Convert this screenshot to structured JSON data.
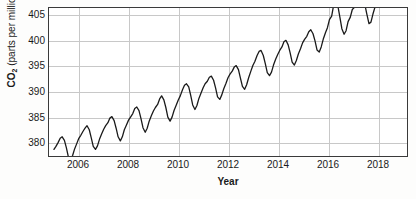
{
  "chart_data": {
    "type": "line",
    "title": "",
    "subtitle": "",
    "xlabel": "Year",
    "ylabel": "CO2 (parts per million)",
    "ylabel_prefix": "CO",
    "ylabel_subscript": "2",
    "ylabel_units": "(parts per million)",
    "xlim": [
      2004.8,
      2019.2
    ],
    "ylim": [
      377.1,
      406.4
    ],
    "grid": true,
    "legend": "none",
    "line_color": "#1a1a1a",
    "grid_color": "#c8c8c8",
    "axis_color": "#3a3a3a",
    "background_color": "#ffffff",
    "xticks": [
      2006,
      2008,
      2010,
      2012,
      2014,
      2016,
      2018
    ],
    "xtick_labels": [
      "2006",
      "2008",
      "2010",
      "2012",
      "2014",
      "2016",
      "2018"
    ],
    "yticks": [
      380,
      385,
      390,
      395,
      400,
      405
    ],
    "ytick_labels": [
      "380",
      "385",
      "390",
      "395",
      "400",
      "405"
    ],
    "series": [
      {
        "name": "Monthly mean CO2",
        "x": [
          2005.0,
          2005.08,
          2005.17,
          2005.25,
          2005.33,
          2005.42,
          2005.5,
          2005.58,
          2005.67,
          2005.75,
          2005.83,
          2005.92,
          2006.0,
          2006.08,
          2006.17,
          2006.25,
          2006.33,
          2006.42,
          2006.5,
          2006.58,
          2006.67,
          2006.75,
          2006.83,
          2006.92,
          2007.0,
          2007.08,
          2007.17,
          2007.25,
          2007.33,
          2007.42,
          2007.5,
          2007.58,
          2007.67,
          2007.75,
          2007.83,
          2007.92,
          2008.0,
          2008.08,
          2008.17,
          2008.25,
          2008.33,
          2008.42,
          2008.5,
          2008.58,
          2008.67,
          2008.75,
          2008.83,
          2008.92,
          2009.0,
          2009.08,
          2009.17,
          2009.25,
          2009.33,
          2009.42,
          2009.5,
          2009.58,
          2009.67,
          2009.75,
          2009.83,
          2009.92,
          2010.0,
          2010.08,
          2010.17,
          2010.25,
          2010.33,
          2010.42,
          2010.5,
          2010.58,
          2010.67,
          2010.75,
          2010.83,
          2010.92,
          2011.0,
          2011.08,
          2011.17,
          2011.25,
          2011.33,
          2011.42,
          2011.5,
          2011.58,
          2011.67,
          2011.75,
          2011.83,
          2011.92,
          2012.0,
          2012.08,
          2012.17,
          2012.25,
          2012.33,
          2012.42,
          2012.5,
          2012.58,
          2012.67,
          2012.75,
          2012.83,
          2012.92,
          2013.0,
          2013.08,
          2013.17,
          2013.25,
          2013.33,
          2013.42,
          2013.5,
          2013.58,
          2013.67,
          2013.75,
          2013.83,
          2013.92,
          2014.0,
          2014.08,
          2014.17,
          2014.25,
          2014.33,
          2014.42,
          2014.5,
          2014.58,
          2014.67,
          2014.75,
          2014.83,
          2014.92,
          2015.0,
          2015.08,
          2015.17,
          2015.25,
          2015.33,
          2015.42,
          2015.5,
          2015.58,
          2015.67,
          2015.75,
          2015.83,
          2015.92,
          2016.0,
          2016.08,
          2016.17,
          2016.25,
          2016.33,
          2016.42,
          2016.5,
          2016.58,
          2016.67,
          2016.75,
          2016.83,
          2016.92,
          2017.0,
          2017.08,
          2017.17,
          2017.25,
          2017.33,
          2017.42,
          2017.5,
          2017.58,
          2017.67,
          2017.75,
          2017.83,
          2017.92,
          2018.0,
          2018.08,
          2018.17,
          2018.25,
          2018.33,
          2018.42
        ],
        "values": [
          378.4,
          379.0,
          379.8,
          380.6,
          380.9,
          380.2,
          378.7,
          376.9,
          376.4,
          377.2,
          378.5,
          379.6,
          380.6,
          381.2,
          382.0,
          382.6,
          383.1,
          382.3,
          380.7,
          379.0,
          378.4,
          379.1,
          380.4,
          381.5,
          382.4,
          383.1,
          383.7,
          384.6,
          384.9,
          384.1,
          382.6,
          380.9,
          380.1,
          380.9,
          382.3,
          383.3,
          384.2,
          384.8,
          385.5,
          386.5,
          386.8,
          386.1,
          384.5,
          382.7,
          381.8,
          382.6,
          384.0,
          385.1,
          386.0,
          386.7,
          387.3,
          388.4,
          389.0,
          388.2,
          386.7,
          384.8,
          384.0,
          384.8,
          386.1,
          387.2,
          388.2,
          389.0,
          390.2,
          391.1,
          391.4,
          390.8,
          389.1,
          387.2,
          386.3,
          387.1,
          388.5,
          389.6,
          390.6,
          391.4,
          391.9,
          392.7,
          392.9,
          392.1,
          390.6,
          388.8,
          388.3,
          389.2,
          390.4,
          391.5,
          392.6,
          393.3,
          393.9,
          394.7,
          395.0,
          394.2,
          392.5,
          390.9,
          390.3,
          391.2,
          392.6,
          393.9,
          395.0,
          395.8,
          397.0,
          397.8,
          398.0,
          397.0,
          395.4,
          393.6,
          393.0,
          393.7,
          395.1,
          396.3,
          397.2,
          398.0,
          398.7,
          399.7,
          400.0,
          399.1,
          397.5,
          395.7,
          395.1,
          396.0,
          397.3,
          398.4,
          399.5,
          400.2,
          400.8,
          401.7,
          402.1,
          401.3,
          399.9,
          398.1,
          397.7,
          398.7,
          400.2,
          401.5,
          402.5,
          404.1,
          404.8,
          407.0,
          407.7,
          406.8,
          404.6,
          402.3,
          401.2,
          401.9,
          403.7,
          404.6,
          406.1,
          406.5,
          407.2,
          409.0,
          409.7,
          409.0,
          407.2,
          405.3,
          403.3,
          403.6,
          405.2,
          406.7,
          408.0,
          408.3,
          409.2,
          410.3,
          411.2,
          410.8
        ]
      }
    ]
  }
}
